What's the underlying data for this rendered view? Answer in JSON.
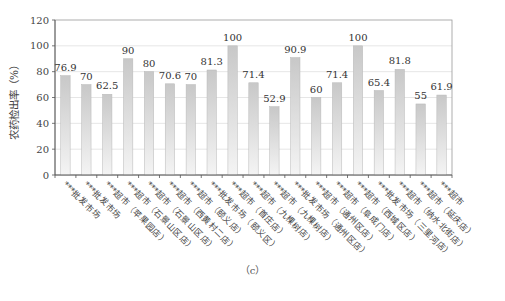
{
  "chart_data": {
    "type": "bar",
    "title": "",
    "xlabel": "",
    "ylabel": "农药检出率（%）",
    "ylim": [
      0,
      120
    ],
    "yticks": [
      0,
      20,
      40,
      60,
      80,
      100,
      120
    ],
    "grid": true,
    "legend": null,
    "categories": [
      "***批发市场",
      "***批发市场",
      "***超市（苹果园店）",
      "***超市（石景山区店）",
      "***超市（石景山区店）",
      "***超市（西黄村二店）",
      "***超市（颐义店）",
      "***批发市场（颐义区）",
      "***超市（首庄店）",
      "***超市（九棵树店）",
      "***超市（九棵树店）",
      "***批发市场（通州区店）",
      "***超市（通州区店）",
      "***超市（阜成门店）",
      "***超市（西城区店）",
      "***批发市场（三里河店）",
      "***超市（纳水北街店）",
      "***超市（延庆店）",
      "***超市"
    ],
    "values": [
      76.9,
      70,
      62.5,
      90,
      80,
      70.6,
      70,
      81.3,
      100,
      71.4,
      52.9,
      90.9,
      60,
      71.4,
      100,
      65.4,
      81.8,
      55,
      61.9
    ],
    "value_labels": [
      "76.9",
      "70",
      "62.5",
      "90",
      "80",
      "70.6",
      "70",
      "81.3",
      "100",
      "71.4",
      "52.9",
      "90.9",
      "60",
      "71.4",
      "100",
      "65.4",
      "81.8",
      "55",
      "61.9"
    ],
    "bar_color_top": "#c8c8c8",
    "bar_color_bottom": "#f4f4f4",
    "bar_border": "#b8b8b8",
    "grid_color": "#e6e6e6",
    "axis_color": "#555555"
  },
  "caption": "（c）"
}
